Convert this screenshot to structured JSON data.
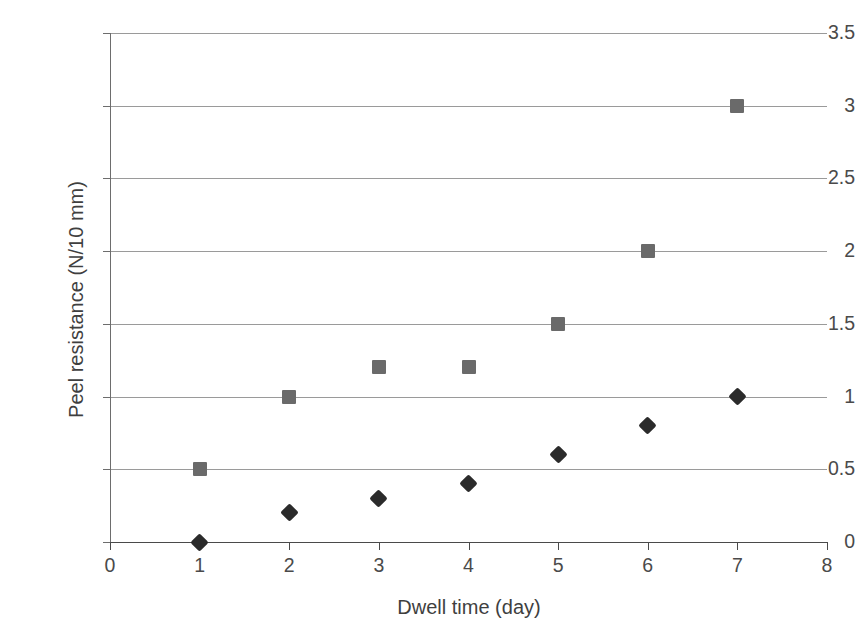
{
  "chart_data": {
    "type": "scatter",
    "title": "",
    "xlabel": "Dwell time (day)",
    "ylabel": "Peel resistance (N/10 mm)",
    "xlim": [
      0,
      8
    ],
    "ylim": [
      0,
      3.5
    ],
    "xticks": [
      "0",
      "1",
      "2",
      "3",
      "4",
      "5",
      "6",
      "7",
      "8"
    ],
    "xtick_values": [
      0,
      1,
      2,
      3,
      4,
      5,
      6,
      7,
      8
    ],
    "yticks": [
      "0",
      "0.5",
      "1",
      "1.5",
      "2",
      "2.5",
      "3",
      "3.5"
    ],
    "ytick_values": [
      0,
      0.5,
      1,
      1.5,
      2,
      2.5,
      3,
      3.5
    ],
    "grid": "horizontal",
    "legend": "none",
    "x": [
      1,
      2,
      3,
      4,
      5,
      6,
      7
    ],
    "series": [
      {
        "name": "series-diamond",
        "marker": "diamond",
        "color": "#2b2b2b",
        "values": [
          0,
          0.2,
          0.3,
          0.4,
          0.6,
          0.8,
          1.0
        ]
      },
      {
        "name": "series-square",
        "marker": "square",
        "color": "#6a6a6a",
        "values": [
          0.5,
          1.0,
          1.2,
          1.2,
          1.5,
          2.0,
          3.0
        ]
      }
    ]
  },
  "colors": {
    "background": "#ffffff",
    "axis": "#4a4a4a",
    "gridline": "#9a9a9a",
    "diamond_series": "#2b2b2b",
    "square_series": "#6a6a6a",
    "text": "#3f3f3f"
  }
}
